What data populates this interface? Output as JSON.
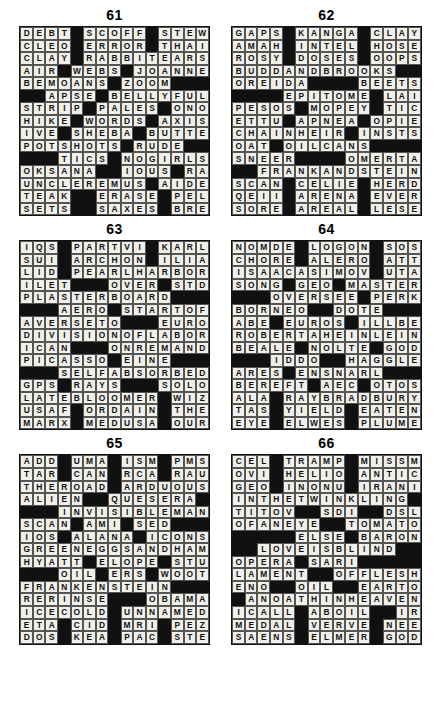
{
  "page": {
    "grid_size": 15,
    "block_char": "#"
  },
  "puzzles": [
    {
      "number": "61",
      "rows": [
        "DEBT#SCOFF#STEW",
        "CLEO#ERROR#THAI",
        "CLAY#RABBITEARS",
        "AIR#WEBS#JOANNE",
        "BEMOANS#ZOOM###",
        "##APSE#BELLYFUL",
        "STRIP#PALES#ONO",
        "HIKE#WORDS#AXIS",
        "IVE#SHEBA#BUTTE",
        "POTSHOTS#RUDE##",
        "###TICS#NOGIRLS",
        "OKSANA##IOUS#RAT",
        "UNCLEREMUS#AIDE",
        "TEAK##ERASE#PELE",
        "SETS##SAXES#BRER"
      ]
    },
    {
      "number": "62",
      "rows": [
        "GAPS#KANGA#CLAY",
        "AMAH#INTEL#HOSE",
        "ROSY#DOSES#OOPS",
        "BUDDANDBROOKS##",
        "OREIDA####BEETS",
        "####EPITOME#LAI",
        "PESOS#MOPEY#TICK",
        "ETTU#APNEA#OPIE",
        "CHAINHEIR#INSTS",
        "OAT#OILCANS####",
        "SNEER####OMERTA",
        "##FRANKANDSTEIN",
        "SCAN#CELIE#HERD",
        "QEII#ARENA#EVER",
        "SORE#AREAL#LESE"
      ]
    },
    {
      "number": "63",
      "rows": [
        "IQS#PARTVI#KARL",
        "SUI#ARCHON#ILIA",
        "LID#PEARLHARBOR",
        "ILET###OVER#STD",
        "PLASTERBOARD###",
        "###AERO#STARTOF",
        "AVERSETO###EURO",
        "DIVISIONOFLABOR",
        "ICAN###ONREMAND",
        "PICASSO#EINE###",
        "###SELFABSORBED",
        "GPS#RAYS###SOLO",
        "LATEBLOOMER#WIZ",
        "USAF#ORDAIN#THE",
        "MARX#MEDUSA#OUR"
      ]
    },
    {
      "number": "64",
      "rows": [
        "NOMDE#LOGON#SOS",
        "CHORE#ALERO#ATT",
        "ISAACASIMOV#UTA",
        "SONG#GEO#MASTER",
        "###OVERSEE#PERK",
        "BORNEO##DOTE###",
        "ABE#EUROS#ILLBE",
        "ROBERTAHEINLEIN",
        "BEALE#NOLTE#GOD",
        "###IDDO##HAGGLE",
        "ARES#ENSNARL###",
        "BEREFT#AEC#OTOS",
        "ALA#RAYBRADBURY",
        "TAS#YIELD#EATEN",
        "EYE#ELWES#PLUME"
      ]
    },
    {
      "number": "65",
      "rows": [
        "ADD#UMA#ISM#PMS",
        "TAR#CAN#RCA#RAU",
        "THEROAD#ARDUOUS",
        "ALIEN##QUESERA",
        "###INVISIBLEMAN",
        "SCAN#AMI#SED###",
        "IOS#ALANA#ICONS",
        "GREENEGGSANDHAM",
        "HYATT#ELOPE#STU",
        "###OIL#ERS#WOOT",
        "FRANKENSTEIN###",
        "RERINSE###OBAMA",
        "ICECOLD#UNNAMED",
        "ETA#CID#MRI#PEZ",
        "DOS#KEA#PAC#STE"
      ]
    },
    {
      "number": "66",
      "rows": [
        "CEL#TRAMP#MISSM",
        "OVI#HELIO#ANTIC",
        "GEO#INONU#IRANI",
        "INTHETWINKLING#",
        "TITOV##SDI##DSL",
        "OFANEYE##TOMATO",
        "#####ELSE#BARON",
        "##LOVEISBLIND##",
        "OPERA#SARI#####",
        "LAMENT##OFFLESH",
        "ENO##OIL##EARTO",
        "#ANOATHINHEAVEN",
        "ICALL#ABOIL##IRK",
        "MEDAL#VERVE#NEE",
        "SAENS#ELMER#GOD"
      ]
    }
  ]
}
